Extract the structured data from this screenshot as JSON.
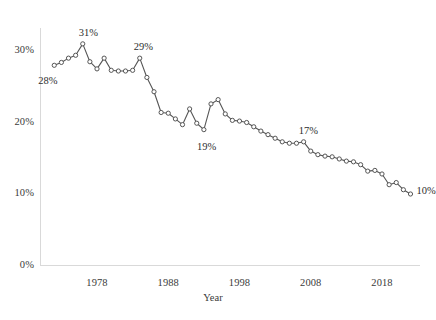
{
  "chart_data": {
    "type": "line",
    "title": "",
    "subtitle": "",
    "xlabel": "Year",
    "ylabel": "",
    "xlim": [
      1971,
      2023
    ],
    "ylim": [
      0,
      33
    ],
    "grid": false,
    "legend": "none",
    "marker": "open-circle",
    "line_color": "#555555",
    "marker_color": "#555555",
    "x_ticks": [
      1978,
      1988,
      1998,
      2008,
      2018
    ],
    "x_tick_labels": [
      "1978",
      "1988",
      "1998",
      "2008",
      "2018"
    ],
    "y_ticks": [
      0,
      10,
      20,
      30
    ],
    "y_tick_labels": [
      "0%",
      "10%",
      "20%",
      "30%"
    ],
    "x": [
      1972,
      1973,
      1974,
      1975,
      1976,
      1977,
      1978,
      1979,
      1980,
      1981,
      1982,
      1983,
      1984,
      1985,
      1986,
      1987,
      1988,
      1989,
      1990,
      1991,
      1992,
      1993,
      1994,
      1995,
      1996,
      1997,
      1998,
      1999,
      2000,
      2001,
      2002,
      2003,
      2004,
      2005,
      2006,
      2007,
      2008,
      2009,
      2010,
      2011,
      2012,
      2013,
      2014,
      2015,
      2016,
      2017,
      2018,
      2019,
      2020,
      2021,
      2022
    ],
    "values": [
      28,
      28.4,
      29,
      29.4,
      31,
      28.5,
      27.5,
      29,
      27.3,
      27.2,
      27.2,
      27.3,
      29,
      26.3,
      24.3,
      21.4,
      21.3,
      20.5,
      19.7,
      21.9,
      19.9,
      19,
      22.6,
      23.2,
      21.2,
      20.3,
      20.2,
      20,
      19.4,
      18.8,
      18.3,
      17.8,
      17.3,
      17.1,
      17.1,
      17.3,
      16,
      15.5,
      15.3,
      15.2,
      14.9,
      14.6,
      14.5,
      14.1,
      13.2,
      13.3,
      12.8,
      11.3,
      11.6,
      10.6,
      10
    ],
    "annotations": [
      {
        "label": "28%",
        "x": 1972,
        "y": 28
      },
      {
        "label": "31%",
        "x": 1976,
        "y": 31
      },
      {
        "label": "29%",
        "x": 1984,
        "y": 29
      },
      {
        "label": "19%",
        "x": 1993,
        "y": 19
      },
      {
        "label": "17%",
        "x": 2007,
        "y": 17.3
      },
      {
        "label": "10%",
        "x": 2022,
        "y": 10
      }
    ]
  },
  "axis": {
    "x_title": "Year"
  }
}
